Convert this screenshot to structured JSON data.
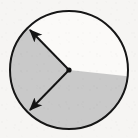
{
  "figure": {
    "title": "Circle with shaded reflex sector and two radius arrows",
    "caption": "",
    "background_color": "#f6f5f3"
  },
  "chart_data": {
    "type": "pie",
    "title": "Circle with shaded reflex sector and two radius arrows",
    "xlabel": "",
    "ylabel": "",
    "legend_position": "none",
    "grid": false,
    "center": {
      "x": 69,
      "y": 70
    },
    "radius": 60,
    "categories": [
      "shaded sector",
      "unshaded wedge"
    ],
    "values": [
      220,
      140
    ],
    "series": [
      {
        "name": "sector angles (degrees)",
        "values": [
          220,
          140
        ]
      }
    ],
    "slices": [
      {
        "label": "shaded sector",
        "start_angle_deg": 134,
        "end_angle_deg": 354,
        "sweep_deg": 220,
        "fill": "#c9c9c9",
        "stroke": "#161616",
        "is_reflex": true
      },
      {
        "label": "unshaded wedge",
        "start_angle_deg": 354,
        "end_angle_deg": 134,
        "sweep_deg": 140,
        "fill": "#fbfaf8",
        "stroke": "#161616",
        "is_reflex": false
      }
    ],
    "annotations": [
      {
        "name": "upper-radius-arrow",
        "from": {
          "x": 69,
          "y": 70
        },
        "to": {
          "x": 30,
          "y": 30
        },
        "angle_deg": 134,
        "label": "",
        "arrowhead": "end"
      },
      {
        "name": "lower-radius-arrow",
        "from": {
          "x": 69,
          "y": 70
        },
        "to": {
          "x": 30,
          "y": 110
        },
        "angle_deg": 226,
        "label": "",
        "arrowhead": "end"
      }
    ]
  },
  "style": {
    "circle_outline_color": "#161616",
    "circle_outline_width": 2,
    "sector_fill_color": "#c9c9c9",
    "wedge_fill_color": "#fbfaf8",
    "arrow_color": "#141414",
    "arrow_width": 2,
    "center_dot_color": "#111111",
    "center_dot_radius": 2.6
  }
}
